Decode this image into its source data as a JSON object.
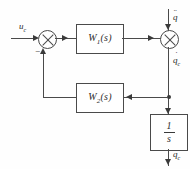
{
  "diagram": {
    "line_color": "#4a4a4a",
    "blocks": [
      {
        "id": "w1",
        "label": "W",
        "subscript": "1",
        "arg": "(s)"
      },
      {
        "id": "w2",
        "label": "W",
        "subscript": "2",
        "arg": "(s)"
      },
      {
        "id": "integrator",
        "numerator": "1",
        "denominator": "s"
      }
    ],
    "junctions": [
      {
        "id": "sum-left",
        "sign_feedback": "−"
      },
      {
        "id": "sum-right",
        "sign_feedback": ""
      }
    ],
    "signals": {
      "input": {
        "base": "u",
        "subscript": "с",
        "dots": ""
      },
      "disturbance": {
        "base": "q",
        "subscript": "",
        "dots": "¨"
      },
      "rate": {
        "base": "q",
        "subscript": "с",
        "dots": "˙"
      },
      "output": {
        "base": "q",
        "subscript": "с",
        "dots": ""
      }
    }
  }
}
